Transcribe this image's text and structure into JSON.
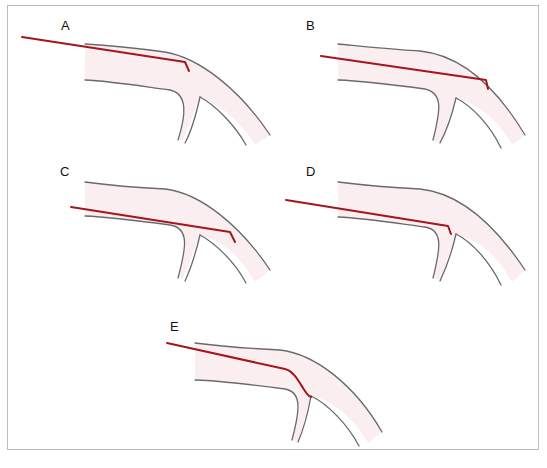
{
  "figure": {
    "panels": [
      {
        "id": "A",
        "label": "A",
        "description": "Guidewire tip hooked at outer wall before branch, proximal"
      },
      {
        "id": "B",
        "label": "B",
        "description": "Guidewire tip reaching outer curve wall beyond branch"
      },
      {
        "id": "C",
        "label": "C",
        "description": "Guidewire entering along lower wall with tip in main vessel beyond branch"
      },
      {
        "id": "D",
        "label": "D",
        "description": "Guidewire tip hooked at branch ostium"
      },
      {
        "id": "E",
        "label": "E",
        "description": "Guidewire curved into branch vessel"
      }
    ],
    "colors": {
      "wire": "#a3161b",
      "vessel_wall": "#6a6a6a",
      "vessel_fill": "#fbeef0",
      "border": "#bdbdbd"
    }
  }
}
